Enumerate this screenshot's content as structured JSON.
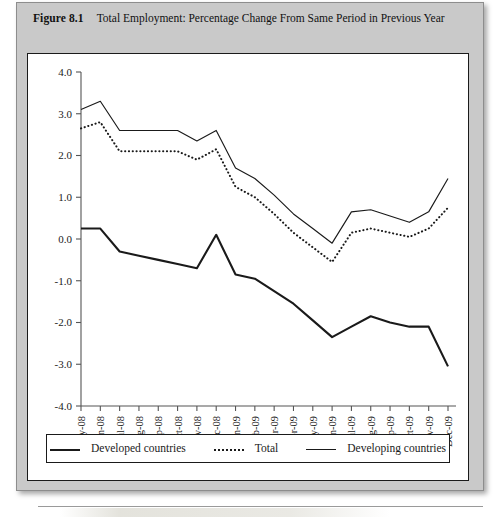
{
  "figure": {
    "label": "Figure 8.1",
    "caption": "Total Employment: Percentage Change From Same Period in Previous Year"
  },
  "legend": {
    "items": [
      {
        "label": "Developed countries",
        "style": "solid-thick",
        "swatch_icon": "line-solid-thick-icon"
      },
      {
        "label": "Total",
        "style": "dotted",
        "swatch_icon": "line-dotted-icon"
      },
      {
        "label": "Developing countries",
        "style": "solid-thin",
        "swatch_icon": "line-solid-thin-icon"
      }
    ]
  },
  "colors": {
    "ink": "#1a1a1a",
    "panel": "#c9c9c9",
    "card": "#ffffff",
    "axis": "#555555"
  },
  "chart_data": {
    "type": "line",
    "title": "Total Employment: Percentage Change From Same Period in Previous Year",
    "xlabel": "",
    "ylabel": "",
    "ylim": [
      -4.0,
      4.0
    ],
    "ytick_step": 1.0,
    "yticks": [
      "4.0",
      "3.0",
      "2.0",
      "1.0",
      "0.0",
      "-1.0",
      "-2.0",
      "-3.0",
      "-4.0"
    ],
    "ytick_values": [
      4.0,
      3.0,
      2.0,
      1.0,
      0.0,
      -1.0,
      -2.0,
      -3.0,
      -4.0
    ],
    "grid": false,
    "legend_position": "bottom",
    "categories": [
      "May-08",
      "Jun-08",
      "Jul-08",
      "Aug-08",
      "Sep-08",
      "Oct-08",
      "Nov-08",
      "Dec-08",
      "Jan-09",
      "Feb-09",
      "Mar-09",
      "Apr-09",
      "May-09",
      "Jun-09",
      "Jul-09",
      "Aug-09",
      "Sep-09",
      "Oct-09",
      "Nov-09",
      "Dec-09"
    ],
    "series": [
      {
        "name": "Developing countries",
        "style": "solid-thin",
        "values": [
          3.1,
          3.3,
          2.6,
          2.6,
          2.6,
          2.6,
          2.35,
          2.6,
          1.7,
          1.45,
          1.05,
          0.6,
          0.25,
          -0.1,
          0.65,
          0.7,
          0.55,
          0.4,
          0.65,
          1.45
        ]
      },
      {
        "name": "Total",
        "style": "dotted",
        "values": [
          2.65,
          2.8,
          2.1,
          2.1,
          2.1,
          2.1,
          1.9,
          2.15,
          1.25,
          1.0,
          0.6,
          0.15,
          -0.2,
          -0.55,
          0.15,
          0.25,
          0.15,
          0.05,
          0.25,
          0.75
        ]
      },
      {
        "name": "Developed countries",
        "style": "solid-thick",
        "values": [
          0.25,
          0.25,
          -0.3,
          -0.4,
          -0.5,
          -0.6,
          -0.7,
          0.1,
          -0.85,
          -0.95,
          -1.25,
          -1.55,
          -1.95,
          -2.35,
          -2.1,
          -1.85,
          -2.0,
          -2.1,
          -2.1,
          -3.05
        ]
      }
    ]
  }
}
